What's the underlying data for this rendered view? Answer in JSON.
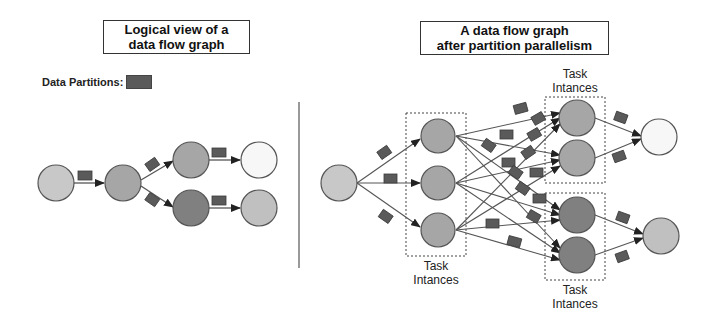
{
  "left_panel": {
    "title_line1": "Logical view of a",
    "title_line2": "data flow graph",
    "legend_label": "Data Partitions:"
  },
  "right_panel": {
    "title_line1": "A data flow graph",
    "title_line2": "after partition parallelism",
    "captions": [
      {
        "line1": "Task",
        "line2": "Intances"
      },
      {
        "line1": "Task",
        "line2": "Intances"
      },
      {
        "line1": "Task",
        "line2": "Intances"
      }
    ]
  },
  "colors": {
    "node_light": "#c8c8c8",
    "node_mid": "#a6a6a6",
    "node_dark": "#808080",
    "node_white": "#f7f7f7",
    "partition": "#5a5a5a",
    "edge": "#555555"
  }
}
